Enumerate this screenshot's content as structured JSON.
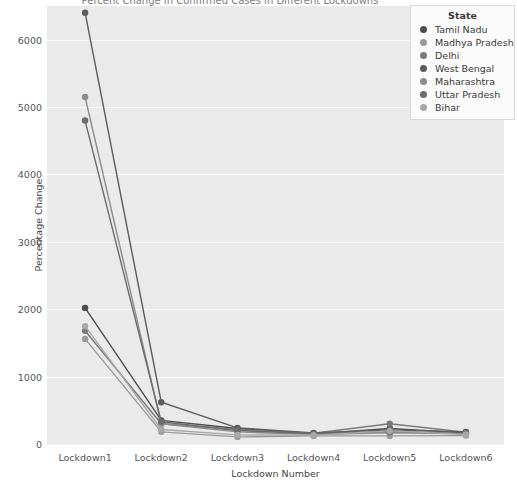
{
  "chart_data": {
    "type": "line",
    "title": "Percent Change in Confirmed Cases in Different Lockdowns",
    "xlabel": "Lockdown Number",
    "ylabel": "Percentage Change",
    "categories": [
      "Lockdown1",
      "Lockdown2",
      "Lockdown3",
      "Lockdown4",
      "Lockdown5",
      "Lockdown6"
    ],
    "ylim": [
      0,
      6500
    ],
    "yticks": [
      0,
      1000,
      2000,
      3000,
      4000,
      5000,
      6000
    ],
    "ytick_labels": [
      "0",
      "1000",
      "2000",
      "3000",
      "4000",
      "5000",
      "6000"
    ],
    "grid": true,
    "legend_position": "upper right",
    "legend_title": "State",
    "series": [
      {
        "name": "Tamil Nadu",
        "color": "#4d4d4d",
        "values": [
          2020,
          350,
          230,
          150,
          230,
          165
        ]
      },
      {
        "name": "Madhya Pradesh",
        "color": "#9a9a9a",
        "values": [
          1560,
          180,
          105,
          120,
          120,
          125
        ]
      },
      {
        "name": "Delhi",
        "color": "#7a7a7a",
        "values": [
          1680,
          300,
          215,
          160,
          300,
          175
        ]
      },
      {
        "name": "West Bengal",
        "color": "#5c5c5c",
        "values": [
          6400,
          620,
          240,
          165,
          210,
          180
        ]
      },
      {
        "name": "Maharashtra",
        "color": "#8c8c8c",
        "values": [
          5150,
          300,
          180,
          140,
          165,
          150
        ]
      },
      {
        "name": "Uttar Pradesh",
        "color": "#6b6b6b",
        "values": [
          4800,
          330,
          200,
          155,
          185,
          155
        ]
      },
      {
        "name": "Bihar",
        "color": "#a8a8a8",
        "values": [
          1750,
          215,
          135,
          130,
          195,
          140
        ]
      }
    ]
  }
}
